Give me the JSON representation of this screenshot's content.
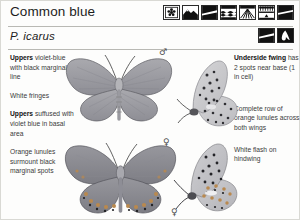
{
  "header": {
    "title": "Common blue",
    "scientific_name": "P. icarus",
    "habitat_icons": [
      {
        "name": "flower-icon",
        "label": "flower"
      },
      {
        "name": "hill-icon",
        "label": "hill"
      },
      {
        "name": "grassland-icon",
        "label": "grassland"
      },
      {
        "name": "wetland-icon",
        "label": "wetland"
      },
      {
        "name": "meadow-icon",
        "label": "meadow"
      },
      {
        "name": "hedgerow-icon",
        "label": "hedgerow"
      },
      {
        "name": "downland-icon",
        "label": "downland"
      }
    ],
    "status_icons": [
      {
        "name": "grassland-icon",
        "label": "grassland"
      },
      {
        "name": "flight-icon",
        "label": "flight"
      }
    ]
  },
  "left_column": [
    {
      "lead": "Uppers",
      "rest": " violet-blue with black marginal line"
    },
    {
      "lead": "",
      "rest": "White fringes"
    },
    {
      "lead": "Uppers",
      "rest": " suffused with violet blue in basal area"
    },
    {
      "lead": "",
      "rest": "Orange lunules surmount black marginal spots"
    }
  ],
  "right_column": [
    {
      "lead": "Underside fwing",
      "rest": " has 2 spots near base (1 in cell)"
    },
    {
      "lead": "",
      "rest": "Complete row of orange lunules across both wings"
    },
    {
      "lead": "",
      "rest": "White flash on hindwing"
    }
  ],
  "plate": {
    "specimens": [
      {
        "name": "male-upperside",
        "sex": "male",
        "sex_symbol": "♂"
      },
      {
        "name": "male-underside",
        "sex": "male",
        "sex_symbol": "♂"
      },
      {
        "name": "female-upperside",
        "sex": "female",
        "sex_symbol": "♀"
      },
      {
        "name": "female-underside",
        "sex": "female",
        "sex_symbol": "♀"
      }
    ]
  },
  "colors": {
    "page_background": "#fdfdfc",
    "text": "#3a3a3a",
    "heading": "#1d1d1d",
    "rule": "#b9b9b4",
    "wing_grey": "#9a9a9e",
    "wing_grey_dark": "#7e7e84"
  }
}
